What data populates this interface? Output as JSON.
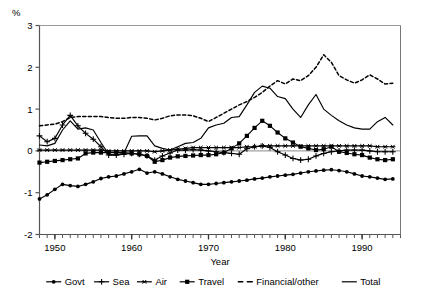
{
  "chart_data": {
    "type": "line",
    "title": "",
    "xlabel": "Year",
    "ylabel": "%",
    "xlim": [
      1948,
      1995
    ],
    "ylim": [
      -2,
      3
    ],
    "yticks": [
      -2,
      -1,
      0,
      1,
      2,
      3
    ],
    "xticks": [
      1950,
      1960,
      1970,
      1980,
      1990
    ],
    "xtick_labels": [
      "1950",
      "1960",
      "1970",
      "1980",
      "1990"
    ],
    "ytick_labels": [
      "-2",
      "-1",
      "0",
      "1",
      "2",
      "3"
    ],
    "minor_xtick_step": 1,
    "grid": false,
    "zero_line": true,
    "legend_position": "bottom",
    "x": [
      1948,
      1949,
      1950,
      1951,
      1952,
      1953,
      1954,
      1955,
      1956,
      1957,
      1958,
      1959,
      1960,
      1961,
      1962,
      1963,
      1964,
      1965,
      1966,
      1967,
      1968,
      1969,
      1970,
      1971,
      1972,
      1973,
      1974,
      1975,
      1976,
      1977,
      1978,
      1979,
      1980,
      1981,
      1982,
      1983,
      1984,
      1985,
      1986,
      1987,
      1988,
      1989,
      1990,
      1991,
      1992,
      1993,
      1994
    ],
    "series": [
      {
        "name": "Govt",
        "marker": "filled-circle",
        "line": "solid",
        "values": [
          -1.15,
          -1.05,
          -0.92,
          -0.8,
          -0.83,
          -0.85,
          -0.8,
          -0.74,
          -0.66,
          -0.62,
          -0.6,
          -0.55,
          -0.5,
          -0.44,
          -0.53,
          -0.5,
          -0.55,
          -0.62,
          -0.68,
          -0.72,
          -0.76,
          -0.8,
          -0.8,
          -0.78,
          -0.76,
          -0.74,
          -0.72,
          -0.7,
          -0.67,
          -0.65,
          -0.62,
          -0.6,
          -0.58,
          -0.56,
          -0.53,
          -0.5,
          -0.48,
          -0.46,
          -0.45,
          -0.47,
          -0.5,
          -0.55,
          -0.6,
          -0.62,
          -0.65,
          -0.68,
          -0.67
        ]
      },
      {
        "name": "Sea",
        "marker": "plus",
        "line": "solid",
        "values": [
          0.36,
          0.22,
          0.3,
          0.62,
          0.85,
          0.6,
          0.42,
          0.28,
          0.1,
          -0.1,
          -0.1,
          -0.08,
          -0.06,
          -0.08,
          -0.12,
          -0.22,
          -0.12,
          -0.05,
          0.02,
          0.02,
          0.03,
          0.02,
          0.0,
          -0.02,
          -0.04,
          -0.06,
          -0.08,
          0.05,
          0.1,
          0.12,
          0.08,
          -0.02,
          -0.1,
          -0.18,
          -0.22,
          -0.2,
          -0.12,
          -0.06,
          -0.02,
          0.0,
          0.02,
          0.02,
          0.02,
          0.0,
          -0.02,
          -0.02,
          -0.02
        ]
      },
      {
        "name": "Air",
        "marker": "star",
        "line": "solid",
        "values": [
          0.02,
          0.02,
          0.02,
          0.02,
          0.02,
          0.02,
          0.02,
          0.02,
          0.02,
          0.0,
          0.0,
          0.0,
          0.0,
          0.0,
          0.0,
          -0.02,
          0.0,
          0.02,
          0.04,
          0.06,
          0.08,
          0.08,
          0.08,
          0.08,
          0.08,
          0.08,
          0.08,
          0.1,
          0.1,
          0.12,
          0.12,
          0.12,
          0.12,
          0.12,
          0.12,
          0.12,
          0.12,
          0.12,
          0.12,
          0.12,
          0.12,
          0.12,
          0.12,
          0.12,
          0.1,
          0.1,
          0.1
        ]
      },
      {
        "name": "Travel",
        "marker": "filled-square",
        "line": "solid",
        "values": [
          -0.28,
          -0.26,
          -0.24,
          -0.22,
          -0.2,
          -0.18,
          -0.06,
          -0.04,
          -0.04,
          -0.04,
          -0.04,
          -0.04,
          -0.06,
          -0.08,
          -0.12,
          -0.26,
          -0.22,
          -0.16,
          -0.13,
          -0.12,
          -0.11,
          -0.1,
          -0.1,
          -0.08,
          -0.04,
          0.06,
          0.18,
          0.36,
          0.55,
          0.72,
          0.6,
          0.44,
          0.3,
          0.2,
          0.1,
          0.06,
          0.02,
          0.04,
          0.1,
          -0.02,
          -0.05,
          -0.08,
          -0.1,
          -0.16,
          -0.2,
          -0.22,
          -0.2
        ]
      },
      {
        "name": "Financial/other",
        "marker": "none",
        "line": "dashed",
        "values": [
          0.6,
          0.62,
          0.64,
          0.7,
          0.8,
          0.82,
          0.82,
          0.82,
          0.82,
          0.8,
          0.78,
          0.78,
          0.8,
          0.8,
          0.78,
          0.74,
          0.78,
          0.84,
          0.86,
          0.86,
          0.84,
          0.78,
          0.7,
          0.8,
          0.9,
          1.0,
          1.1,
          1.18,
          1.28,
          1.4,
          1.55,
          1.68,
          1.6,
          1.72,
          1.68,
          1.8,
          2.0,
          2.3,
          2.12,
          1.8,
          1.7,
          1.62,
          1.7,
          1.82,
          1.72,
          1.6,
          1.62
        ]
      },
      {
        "name": "Total",
        "marker": "none",
        "line": "solid",
        "values": [
          0.14,
          0.12,
          0.18,
          0.5,
          0.72,
          0.52,
          0.55,
          0.5,
          0.2,
          -0.08,
          -0.1,
          -0.05,
          0.35,
          0.36,
          0.36,
          0.12,
          0.06,
          0.02,
          0.1,
          0.18,
          0.2,
          0.3,
          0.55,
          0.62,
          0.66,
          0.8,
          0.82,
          1.1,
          1.4,
          1.55,
          1.5,
          1.3,
          1.25,
          1.0,
          0.8,
          1.1,
          1.35,
          1.0,
          0.85,
          0.72,
          0.62,
          0.55,
          0.52,
          0.52,
          0.7,
          0.8,
          0.62
        ]
      }
    ]
  },
  "legend": {
    "items": [
      {
        "label": "Govt",
        "marker": "filled-circle",
        "line": "solid"
      },
      {
        "label": "Sea",
        "marker": "plus",
        "line": "solid"
      },
      {
        "label": "Air",
        "marker": "star",
        "line": "solid"
      },
      {
        "label": "Travel",
        "marker": "filled-square",
        "line": "solid"
      },
      {
        "label": "Financial/other",
        "marker": "none",
        "line": "dashed"
      },
      {
        "label": "Total",
        "marker": "none",
        "line": "solid"
      }
    ]
  }
}
